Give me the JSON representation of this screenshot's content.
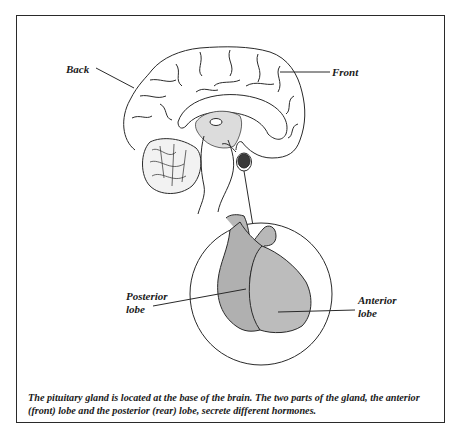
{
  "figure": {
    "labels": {
      "back": "Back",
      "front": "Front",
      "posterior_lobe_line1": "Posterior",
      "posterior_lobe_line2": "lobe",
      "anterior_lobe_line1": "Anterior",
      "anterior_lobe_line2": "lobe"
    },
    "caption": "The pituitary gland is located at the base of the brain. The two parts of the gland, the anterior (front) lobe and the posterior (rear) lobe, secrete different hormones.",
    "colors": {
      "line": "#2a2a2a",
      "gland_fill": "#b8b8b8",
      "gland_dark": "#3a3a3a",
      "stipple": "#cfcfcf"
    }
  }
}
